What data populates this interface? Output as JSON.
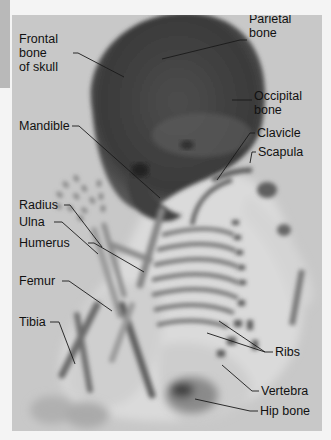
{
  "figure": {
    "labels": {
      "frontal": "Frontal\nbone\nof skull",
      "parietal": "Parietal\nbone",
      "occipital": "Occipital\nbone",
      "mandible": "Mandible",
      "clavicle": "Clavicle",
      "scapula": "Scapula",
      "radius": "Radius",
      "ulna": "Ulna",
      "humerus": "Humerus",
      "femur": "Femur",
      "tibia": "Tibia",
      "ribs": "Ribs",
      "vertebra": "Vertebra",
      "hip_bone": "Hip bone"
    }
  },
  "colors": {
    "background": "#f4f4f4",
    "panel": "#c8c8c8",
    "tab": "#b9b9b9",
    "label_text": "#111111",
    "leader_line": "#1a1a1a"
  }
}
